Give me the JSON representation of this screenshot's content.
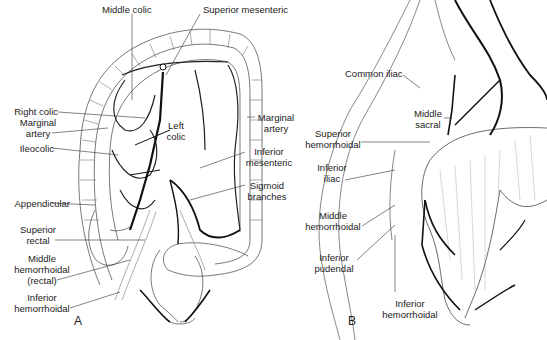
{
  "figure": {
    "panels": [
      {
        "id": "A",
        "label": "A"
      },
      {
        "id": "B",
        "label": "B"
      }
    ]
  },
  "panelA": {
    "labels": {
      "middle_colic": "Middle colic",
      "superior_mesenteric": "Superior mesenteric",
      "right_colic": "Right colic",
      "marginal_artery_left_1": "Marginal",
      "marginal_artery_left_2": "artery",
      "ileocolic": "Ileocolic",
      "left_colic_1": "Left",
      "left_colic_2": "colic",
      "marginal_artery_right_1": "Marginal",
      "marginal_artery_right_2": "artery",
      "inferior_mesenteric_1": "Inferior",
      "inferior_mesenteric_2": "mesenteric",
      "sigmoid_branches_1": "Sigmoid",
      "sigmoid_branches_2": "branches",
      "appendicular": "Appendicular",
      "superior_rectal_1": "Superior",
      "superior_rectal_2": "rectal",
      "middle_hemorrhoidal_1": "Middle",
      "middle_hemorrhoidal_2": "hemorrhoidal",
      "middle_hemorrhoidal_3": "(rectal)",
      "inferior_hemorrhoidal_1": "Inferior",
      "inferior_hemorrhoidal_2": "hemorrhoidal"
    }
  },
  "panelB": {
    "labels": {
      "common_iliac": "Common iliac",
      "middle_sacral_1": "Middle",
      "middle_sacral_2": "sacral",
      "superior_hemorrhoidal_1": "Superior",
      "superior_hemorrhoidal_2": "hemorrhoidal",
      "inferior_iliac_1": "Inferior",
      "inferior_iliac_2": "iliac",
      "middle_hemorrhoidal_1": "Middle",
      "middle_hemorrhoidal_2": "hemorrhoidal",
      "inferior_pudendal_1": "Inferior",
      "inferior_pudendal_2": "pudendal",
      "inferior_hemorrhoidal_1": "Inferior",
      "inferior_hemorrhoidal_2": "hemorrhoidal"
    }
  },
  "colors": {
    "ink": "#222222",
    "vessel": "#111111",
    "outline": "#555555",
    "background": "#ffffff"
  }
}
